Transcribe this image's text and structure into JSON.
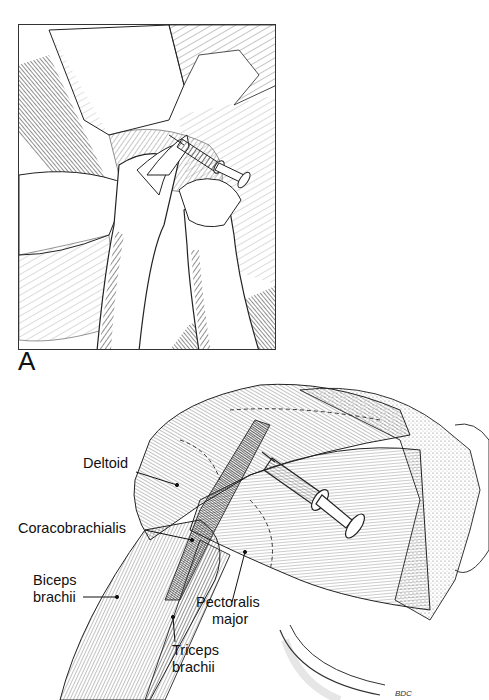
{
  "figure": {
    "panel_a": {
      "label": "A",
      "description": "Hatched pen illustration: clinician's hands injecting into patient's shoulder/pectoral region with a syringe"
    },
    "panel_b": {
      "description": "Anatomical drawing of shoulder and upper arm musculature with syringe inserted into the deltoid/pectoral region",
      "labels": [
        {
          "id": "deltoid",
          "lines": [
            "Deltoid"
          ]
        },
        {
          "id": "coracobrachialis",
          "lines": [
            "Coracobrachialis"
          ]
        },
        {
          "id": "biceps",
          "lines": [
            "Biceps",
            "brachii"
          ]
        },
        {
          "id": "pectoralis",
          "lines": [
            "Pectoralis",
            "major"
          ]
        },
        {
          "id": "triceps",
          "lines": [
            "Triceps",
            "brachii"
          ]
        }
      ],
      "signature": "BDC"
    }
  }
}
